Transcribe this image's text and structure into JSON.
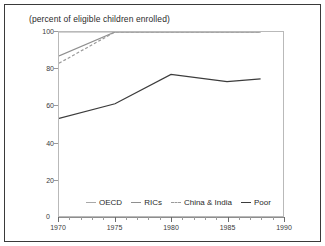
{
  "chart_data": {
    "type": "line",
    "title": "(percent of eligible children enrolled)",
    "xlabel": "",
    "ylabel": "",
    "xlim": [
      1970,
      1990
    ],
    "ylim": [
      0,
      100
    ],
    "yticks": [
      0,
      20,
      40,
      60,
      80,
      100
    ],
    "xticks": [
      1970,
      1975,
      1980,
      1985,
      1990
    ],
    "xtick_labels": [
      "1970",
      "1975",
      "1980",
      "1985",
      "1990"
    ],
    "ytick_labels": [
      "0",
      "20",
      "40",
      "60",
      "80",
      "100"
    ],
    "grid": false,
    "legend_position": "inside-bottom-center",
    "series": [
      {
        "name": "OECD",
        "color": "#a8a8a8",
        "style": "solid",
        "x": [
          1970,
          1975,
          1980,
          1985,
          1988
        ],
        "values": [
          100,
          100,
          100,
          100,
          100
        ]
      },
      {
        "name": "RICs",
        "color": "#8f8f8f",
        "style": "solid",
        "x": [
          1970,
          1975,
          1980,
          1985,
          1988
        ],
        "values": [
          87,
          100,
          100,
          100,
          100
        ]
      },
      {
        "name": "China & India",
        "color": "#9a9a9a",
        "style": "dashed",
        "x": [
          1970,
          1975,
          1980,
          1985,
          1988
        ],
        "values": [
          83,
          100,
          100,
          100,
          100
        ]
      },
      {
        "name": "Poor",
        "color": "#3c3c3c",
        "style": "solid",
        "x": [
          1970,
          1975,
          1980,
          1985,
          1988
        ],
        "values": [
          53,
          61,
          77,
          73,
          74.5
        ]
      }
    ]
  },
  "legend": {
    "items": [
      {
        "label": "OECD"
      },
      {
        "label": "RICs"
      },
      {
        "label": "China & India"
      },
      {
        "label": "Poor"
      }
    ]
  },
  "axis": {
    "zero_label": "0"
  }
}
